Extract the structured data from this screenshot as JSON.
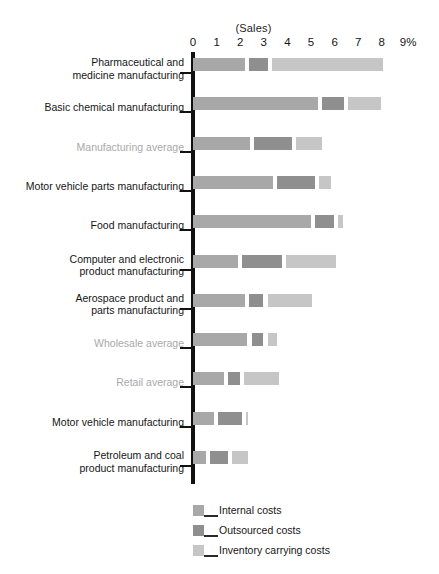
{
  "chart_data": {
    "type": "bar",
    "orientation": "horizontal",
    "stacked": true,
    "title": "(Sales)",
    "xlabel": "",
    "ylabel": "",
    "xlim": [
      0,
      9
    ],
    "grid": false,
    "legend_position": "bottom",
    "tick_labels": [
      "0",
      "1",
      "2",
      "3",
      "4",
      "5",
      "6",
      "7",
      "8",
      "9%"
    ],
    "tick_values": [
      0,
      1,
      2,
      3,
      4,
      5,
      6,
      7,
      8,
      9
    ],
    "categories": [
      "Pharmaceutical and\nmedicine manufacturing",
      "Basic chemical manufacturing",
      "Manufacturing average",
      "Motor vehicle parts manufacturing",
      "Food manufacturing",
      "Computer and electronic\nproduct manufacturing",
      "Aerospace product and\nparts manufacturing",
      "Wholesale average",
      "Retail average",
      "Motor vehicle manufacturing",
      "Petroleum and coal\nproduct manufacturing"
    ],
    "category_styles": [
      "normal",
      "normal",
      "muted",
      "normal",
      "normal",
      "normal",
      "normal",
      "muted",
      "muted",
      "normal",
      "normal"
    ],
    "series": [
      {
        "name": "Internal costs",
        "color": "#a8a8a8",
        "values": [
          2.2,
          5.3,
          2.4,
          3.4,
          5.0,
          1.9,
          2.2,
          2.3,
          1.3,
          0.9,
          0.55
        ]
      },
      {
        "name": "Outsourced costs",
        "color": "#8f8f8f",
        "values": [
          0.8,
          0.9,
          1.6,
          1.6,
          0.8,
          1.7,
          0.6,
          0.5,
          0.5,
          1.0,
          0.75
        ]
      },
      {
        "name": "Inventory carrying costs",
        "color": "#c6c6c6",
        "values": [
          4.7,
          1.4,
          1.1,
          0.5,
          0.2,
          2.1,
          1.9,
          0.4,
          1.5,
          0.08,
          0.65
        ]
      }
    ],
    "totals": [
      7.7,
      7.6,
      5.1,
      5.5,
      6.0,
      5.7,
      4.7,
      3.2,
      3.3,
      1.98,
      1.95
    ],
    "legend": [
      {
        "label": "Internal costs",
        "color": "#a8a8a8"
      },
      {
        "label": "Outsourced costs",
        "color": "#8f8f8f"
      },
      {
        "label": "Inventory carrying costs",
        "color": "#c6c6c6"
      }
    ]
  }
}
